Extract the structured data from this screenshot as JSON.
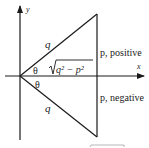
{
  "diagram": {
    "axes": {
      "x_label": "x",
      "y_label": "y"
    },
    "labels": {
      "hyp_upper": "q",
      "hyp_lower": "q",
      "theta_upper": "θ",
      "theta_lower": "θ",
      "adjacent": "q² − p²",
      "p_positive": "p, positive",
      "p_negative": "p, negative"
    },
    "colors": {
      "stroke": "#1a1a1a",
      "background": "#ffffff"
    }
  }
}
